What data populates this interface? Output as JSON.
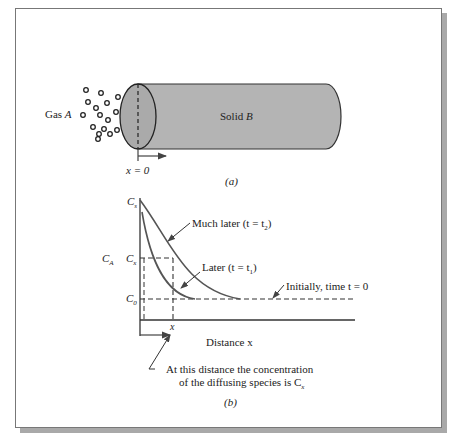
{
  "figure_a": {
    "gas_label": "Gas ",
    "gas_var": "A",
    "solid_label": "Solid ",
    "solid_var": "B",
    "origin_label": "x = 0",
    "caption": "(a)",
    "solid_color": "#b4b4b4"
  },
  "figure_b": {
    "y_labels": {
      "cs": "C",
      "cs_sub": "s",
      "cx": "C",
      "cx_sub": "x",
      "c0": "C",
      "c0_sub": "0",
      "ca": "C",
      "ca_sub": "A"
    },
    "x_tick": "x",
    "x_axis_label": "Distance x",
    "curve_much_later": "Much later (t = t",
    "curve_much_later_sub": "2",
    "curve_later": "Later (t = t",
    "curve_later_sub": "1",
    "initial_label": "Initially, time t = 0",
    "annotation_line1": "At this distance the concentration",
    "annotation_line2": "of the diffusing species is C",
    "annotation_sub": "x",
    "caption": "(b)"
  }
}
